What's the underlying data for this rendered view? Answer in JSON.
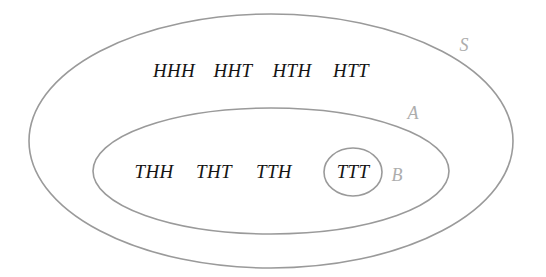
{
  "diagram": {
    "background_color": "#ffffff",
    "stroke_color": "#9a9a9a",
    "outcome_text_color": "#141414",
    "set_label_color": "#adadad"
  },
  "sets": {
    "universe": {
      "label": "S",
      "shape": "ellipse",
      "cx": 271,
      "cy": 141,
      "rx": 242,
      "ry": 127,
      "label_x": 464,
      "label_y": 45
    },
    "a": {
      "label": "A",
      "shape": "ellipse",
      "cx": 271,
      "cy": 171,
      "rx": 178,
      "ry": 63,
      "label_x": 413,
      "label_y": 113
    },
    "b": {
      "label": "B",
      "shape": "ellipse",
      "cx": 353,
      "cy": 172,
      "rx": 29,
      "ry": 24,
      "label_x": 397,
      "label_y": 175
    }
  },
  "outcomes": {
    "top_row": [
      {
        "text": "HHH",
        "x": 174,
        "y": 71
      },
      {
        "text": "HHT",
        "x": 233,
        "y": 71
      },
      {
        "text": "HTH",
        "x": 292,
        "y": 71
      },
      {
        "text": "HTT",
        "x": 351,
        "y": 71
      }
    ],
    "bottom_row": [
      {
        "text": "THH",
        "x": 154,
        "y": 172
      },
      {
        "text": "THT",
        "x": 214,
        "y": 172
      },
      {
        "text": "TTH",
        "x": 274,
        "y": 172
      },
      {
        "text": "TTT",
        "x": 353,
        "y": 172
      }
    ]
  }
}
